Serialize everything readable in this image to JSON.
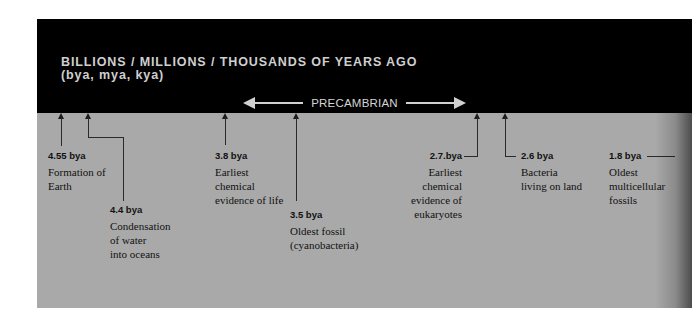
{
  "header": {
    "title": "BILLIONS / MILLIONS / THOUSANDS OF YEARS AGO",
    "subtitle": "(bya, mya, kya)",
    "era_label": "PRECAMBRIAN"
  },
  "colors": {
    "band": "#000000",
    "panel": "#a9a9a9",
    "header_text": "#cfcfcf",
    "body_text": "#111111"
  },
  "events": [
    {
      "date": "4.55 bya",
      "description": "Formation of\nEarth"
    },
    {
      "date": "4.4 bya",
      "description": "Condensation\nof water\ninto oceans"
    },
    {
      "date": "3.8 bya",
      "description": "Earliest\nchemical\nevidence of life"
    },
    {
      "date": "3.5 bya",
      "description": "Oldest fossil\n(cyanobacteria)"
    },
    {
      "date": "2.7.bya",
      "description": "Earliest\nchemical\nevidence of\neukaryotes"
    },
    {
      "date": "2.6 bya",
      "description": "Bacteria\nliving on land"
    },
    {
      "date": "1.8 bya",
      "description": "Oldest\nmulticellular\nfossils"
    }
  ]
}
